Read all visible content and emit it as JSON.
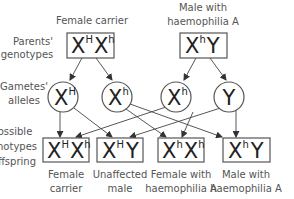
{
  "row_labels": {
    "parents": [
      "Parents'",
      "genotypes"
    ],
    "gametes": [
      "Gametes'",
      "alleles"
    ],
    "offspring": [
      "ossible",
      "hotypes",
      "ffspring"
    ]
  },
  "parents": [
    {
      "label": [
        "Female carrier"
      ],
      "genotype": [
        {
          "base": "X",
          "sup": "H"
        },
        {
          "base": "X",
          "sup": "h"
        }
      ]
    },
    {
      "label": [
        "Male with",
        "haemophilia A"
      ],
      "genotype": [
        {
          "base": "X",
          "sup": "h"
        },
        {
          "base": "Y",
          "sup": ""
        }
      ]
    }
  ],
  "gametes": [
    {
      "base": "X",
      "sup": "H"
    },
    {
      "base": "X",
      "sup": "h"
    },
    {
      "base": "X",
      "sup": "h"
    },
    {
      "base": "Y",
      "sup": ""
    }
  ],
  "offspring": [
    {
      "genotype": [
        {
          "base": "X",
          "sup": "H"
        },
        {
          "base": "X",
          "sup": "h"
        }
      ],
      "label": [
        "Female",
        "carrier"
      ]
    },
    {
      "genotype": [
        {
          "base": "X",
          "sup": "H"
        },
        {
          "base": "Y",
          "sup": ""
        }
      ],
      "label": [
        "Unaffected",
        "male"
      ]
    },
    {
      "genotype": [
        {
          "base": "X",
          "sup": "h"
        },
        {
          "base": "X",
          "sup": "h"
        }
      ],
      "label": [
        "Female with",
        "haemophilia A"
      ]
    },
    {
      "genotype": [
        {
          "base": "X",
          "sup": "h"
        },
        {
          "base": "Y",
          "sup": ""
        }
      ],
      "label": [
        "Male with",
        "haemophilia A"
      ]
    }
  ]
}
